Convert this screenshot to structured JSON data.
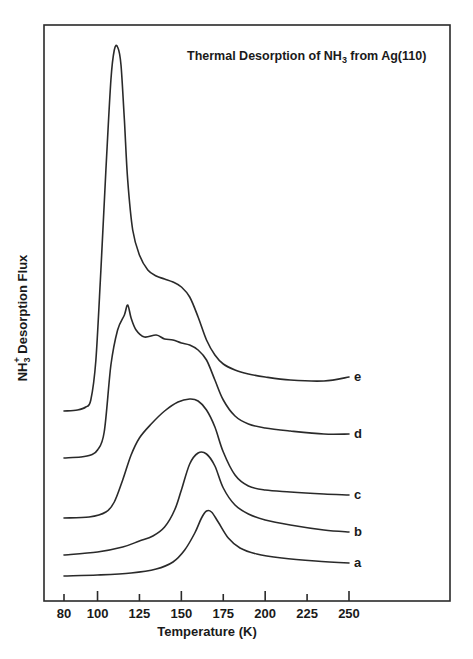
{
  "chart_data": {
    "type": "line",
    "title": "Thermal Desorption of NH3 from Ag(110)",
    "title_parts": {
      "pre": "Thermal Desorption of NH",
      "sub": "3",
      "post": " from Ag(110)"
    },
    "xlabel": "Temperature (K)",
    "ylabel": "NH3+ Desorption Flux",
    "ylabel_parts": {
      "pre": "NH",
      "sub": "3",
      "sup": "+",
      "post": " Desorption Flux"
    },
    "xlim": [
      80,
      250
    ],
    "x_ticks": [
      80,
      100,
      125,
      150,
      175,
      200,
      225,
      250
    ],
    "y_units": "arbitrary (curves vertically offset)",
    "grid": false,
    "legend": "inline labels at right end of each curve",
    "series": [
      {
        "name": "a",
        "x": [
          80,
          100,
          120,
          135,
          145,
          152,
          158,
          162,
          165,
          168,
          172,
          178,
          185,
          195,
          210,
          230,
          250
        ],
        "y": [
          24,
          25,
          27,
          31,
          38,
          50,
          67,
          82,
          89,
          88,
          78,
          62,
          52,
          46,
          42,
          39,
          37
        ]
      },
      {
        "name": "b",
        "x": [
          80,
          100,
          115,
          125,
          133,
          140,
          146,
          150,
          155,
          160,
          165,
          170,
          175,
          182,
          190,
          200,
          215,
          235,
          250
        ],
        "y": [
          45,
          48,
          53,
          59,
          64,
          73,
          90,
          110,
          136,
          147,
          146,
          134,
          112,
          95,
          86,
          80,
          75,
          70,
          68
        ]
      },
      {
        "name": "c",
        "x": [
          80,
          95,
          105,
          110,
          115,
          120,
          125,
          132,
          140,
          148,
          155,
          160,
          165,
          170,
          175,
          182,
          190,
          200,
          215,
          235,
          250
        ],
        "y": [
          82,
          83,
          88,
          98,
          120,
          145,
          162,
          176,
          189,
          198,
          201,
          199,
          190,
          173,
          148,
          125,
          114,
          110,
          108,
          106,
          105
        ]
      },
      {
        "name": "d",
        "x": [
          80,
          90,
          96,
          100,
          104,
          108,
          112,
          116,
          118,
          120,
          123,
          128,
          135,
          140,
          145,
          150,
          155,
          160,
          165,
          170,
          175,
          182,
          190,
          200,
          215,
          235,
          250
        ],
        "y": [
          142,
          143,
          145,
          150,
          168,
          235,
          270,
          285,
          295,
          282,
          270,
          263,
          265,
          261,
          260,
          257,
          255,
          250,
          240,
          220,
          200,
          184,
          176,
          172,
          169,
          166,
          166
        ]
      },
      {
        "name": "e",
        "x": [
          80,
          88,
          93,
          96,
          99,
          102,
          105,
          108,
          110,
          112,
          114,
          116,
          118,
          121,
          125,
          130,
          135,
          140,
          145,
          150,
          155,
          160,
          165,
          170,
          175,
          182,
          190,
          200,
          215,
          235,
          250
        ],
        "y": [
          189,
          190,
          193,
          200,
          240,
          330,
          430,
          520,
          550,
          553,
          535,
          480,
          420,
          370,
          345,
          330,
          324,
          321,
          318,
          313,
          303,
          283,
          260,
          245,
          236,
          230,
          226,
          223,
          220,
          219,
          223
        ]
      }
    ]
  },
  "labels": {
    "title_pre": "Thermal Desorption of NH",
    "title_sub": "3",
    "title_post": " from Ag(110)",
    "xlabel": "Temperature (K)",
    "ylabel_pre": "NH",
    "ylabel_sub": "3",
    "ylabel_sup": "+",
    "ylabel_post": " Desorption Flux"
  }
}
